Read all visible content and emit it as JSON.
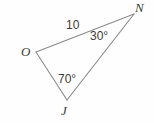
{
  "figure": {
    "kind": "geometry-diagram",
    "shape": "triangle",
    "background_color": "#fefefe",
    "stroke_color": "#8a8a8a",
    "text_color": "#3a3a3a"
  },
  "vertices": {
    "o": {
      "label": "O",
      "x": 36,
      "y": 52
    },
    "n": {
      "label": "N",
      "x": 134,
      "y": 14
    },
    "j": {
      "label": "J",
      "x": 67,
      "y": 100
    }
  },
  "sides": {
    "on": {
      "label": "10",
      "from": "O",
      "to": "N"
    },
    "nj": {
      "label": "",
      "from": "N",
      "to": "J"
    },
    "jo": {
      "label": "",
      "from": "J",
      "to": "O"
    }
  },
  "angles": {
    "at_n": {
      "label": "30°",
      "value": 30,
      "vertex": "N"
    },
    "at_j": {
      "label": "70°",
      "value": 70,
      "vertex": "J"
    }
  }
}
